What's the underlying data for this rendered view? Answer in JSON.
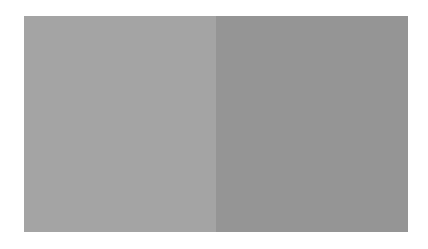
{
  "caption_top": "",
  "caption_bottom": "",
  "panels": [
    {
      "name": "left-panel",
      "color": "#a4a4a4"
    },
    {
      "name": "right-panel",
      "color": "#959595"
    }
  ]
}
